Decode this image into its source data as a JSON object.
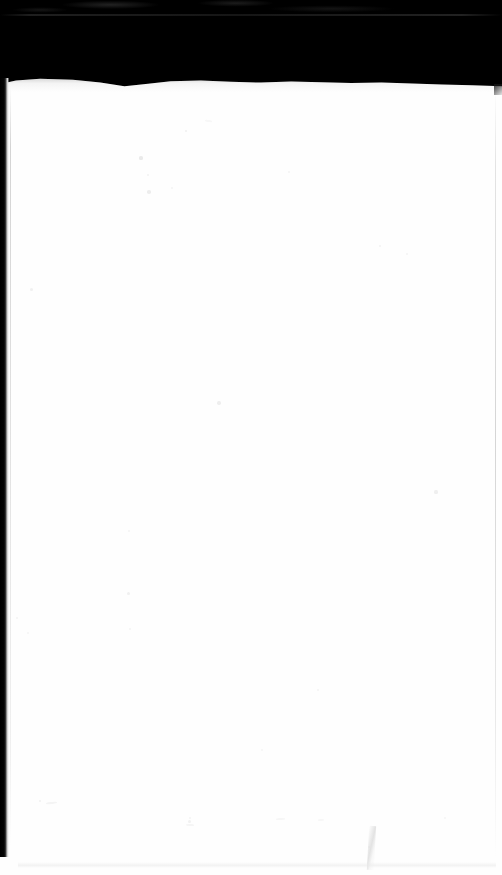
{
  "document": {
    "kind": "scanned-page",
    "title": "Scanned blank page",
    "page_content_text": "",
    "visible_text": [],
    "orientation": "portrait",
    "width_px": 502,
    "height_px": 875
  },
  "colors": {
    "scanner_backdrop": "#000000",
    "paper": "#fefefe",
    "edge_shadow": "#000000",
    "page_edge_line": "#c4c4c4",
    "speck": "#d9d9d9"
  },
  "regions": {
    "top_black_band": {
      "name": "scanner-backdrop-top",
      "top_px": 0,
      "bottom_px": 82,
      "color": "#000000"
    },
    "paper_sheet": {
      "name": "paper-sheet",
      "top_px": 78,
      "left_px": 0,
      "width_px": 502,
      "height_px": 797,
      "color": "#fefefe"
    },
    "left_edge_shadow": {
      "name": "left-edge-shadow",
      "left_px": 0,
      "width_px": 9,
      "top_px": 78,
      "height_px": 779
    },
    "right_page_edge": {
      "name": "right-page-edge",
      "left_px": 495,
      "top_px": 88,
      "height_px": 770
    }
  },
  "artifacts": {
    "seam_label": "backdrop-seam",
    "crease_label": "crease-mark",
    "specks": [
      {
        "x": 141,
        "y": 158,
        "r": 1.6,
        "o": 0.55
      },
      {
        "x": 186,
        "y": 131,
        "r": 1.1,
        "o": 0.4
      },
      {
        "x": 148,
        "y": 175,
        "r": 1.3,
        "o": 0.35
      },
      {
        "x": 149,
        "y": 192,
        "r": 1.8,
        "o": 0.45
      },
      {
        "x": 172,
        "y": 188,
        "r": 1.0,
        "o": 0.3
      },
      {
        "x": 289,
        "y": 172,
        "r": 1.2,
        "o": 0.3
      },
      {
        "x": 380,
        "y": 246,
        "r": 1.4,
        "o": 0.35
      },
      {
        "x": 407,
        "y": 254,
        "r": 1.0,
        "o": 0.28
      },
      {
        "x": 31,
        "y": 289,
        "r": 1.5,
        "o": 0.38
      },
      {
        "x": 219,
        "y": 403,
        "r": 1.7,
        "o": 0.42
      },
      {
        "x": 129,
        "y": 531,
        "r": 1.2,
        "o": 0.3
      },
      {
        "x": 128,
        "y": 593,
        "r": 1.5,
        "o": 0.36
      },
      {
        "x": 130,
        "y": 629,
        "r": 1.1,
        "o": 0.28
      },
      {
        "x": 17,
        "y": 618,
        "r": 1.3,
        "o": 0.3
      },
      {
        "x": 28,
        "y": 633,
        "r": 1.0,
        "o": 0.26
      },
      {
        "x": 436,
        "y": 492,
        "r": 1.6,
        "o": 0.4
      },
      {
        "x": 318,
        "y": 690,
        "r": 1.2,
        "o": 0.3
      },
      {
        "x": 40,
        "y": 801,
        "r": 1.4,
        "o": 0.33
      },
      {
        "x": 189,
        "y": 821,
        "r": 1.5,
        "o": 0.35
      },
      {
        "x": 262,
        "y": 750,
        "r": 1.1,
        "o": 0.26
      },
      {
        "x": 190,
        "y": 818,
        "r": 1.2,
        "o": 0.3
      },
      {
        "x": 369,
        "y": 847,
        "r": 1.3,
        "o": 0.3
      },
      {
        "x": 445,
        "y": 818,
        "r": 1.1,
        "o": 0.26
      }
    ],
    "flecks": [
      {
        "x": 46,
        "y": 802,
        "w": 11,
        "h": 2,
        "rot": -6,
        "o": 0.35
      },
      {
        "x": 186,
        "y": 824,
        "w": 8,
        "h": 2,
        "rot": 4,
        "o": 0.3
      },
      {
        "x": 276,
        "y": 818,
        "w": 9,
        "h": 2,
        "rot": -3,
        "o": 0.28
      },
      {
        "x": 205,
        "y": 120,
        "w": 7,
        "h": 2,
        "rot": 8,
        "o": 0.25
      },
      {
        "x": 318,
        "y": 819,
        "w": 6,
        "h": 2,
        "rot": -5,
        "o": 0.24
      }
    ]
  }
}
